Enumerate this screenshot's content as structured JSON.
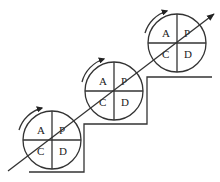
{
  "diagram": {
    "line_color": "#333333",
    "background": "#ffffff",
    "cycles": [
      {
        "id": "cycle-1",
        "cx": 52,
        "cy": 140,
        "r": 29,
        "quadrants": {
          "top_left": "A",
          "top_right": "P",
          "bottom_left": "C",
          "bottom_right": "D"
        }
      },
      {
        "id": "cycle-2",
        "cx": 114,
        "cy": 91,
        "r": 29,
        "quadrants": {
          "top_left": "A",
          "top_right": "P",
          "bottom_left": "C",
          "bottom_right": "D"
        }
      },
      {
        "id": "cycle-3",
        "cx": 177,
        "cy": 43,
        "r": 29,
        "quadrants": {
          "top_left": "A",
          "top_right": "P",
          "bottom_left": "C",
          "bottom_right": "D"
        }
      }
    ],
    "progress_arrow": {
      "x1": 8,
      "y1": 171,
      "x2": 214,
      "y2": 14
    },
    "staircase_points": "29,172 84,172 84,124 147,124 147,77 212,77",
    "rotation_direction": "clockwise"
  }
}
